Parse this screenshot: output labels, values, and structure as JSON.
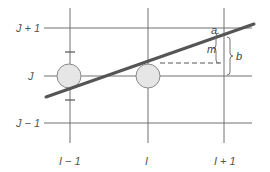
{
  "diagram": {
    "type": "grid-line-intersection",
    "row_labels": [
      "J + 1",
      "J",
      "J − 1"
    ],
    "column_labels": [
      "I − 1",
      "I",
      "I + 1"
    ],
    "annotations": {
      "a": "a",
      "m": "m",
      "b": "b"
    },
    "colors": {
      "grid": "#707070",
      "line": "#555555",
      "circle_fill": "#e6e6e6",
      "circle_stroke": "#8a8a8a",
      "text": "#555555"
    }
  }
}
